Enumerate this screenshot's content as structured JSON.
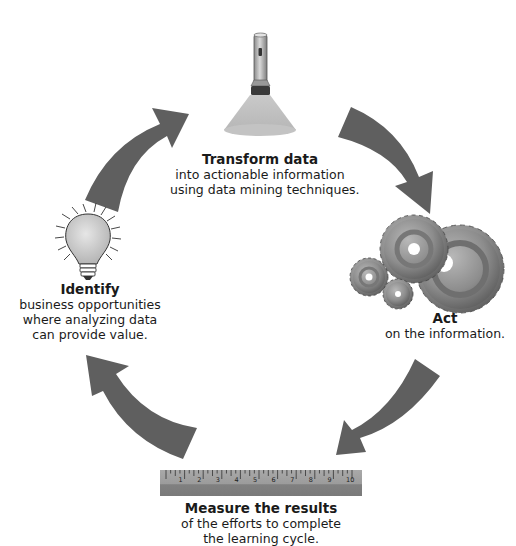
{
  "diagram": {
    "type": "cycle",
    "arrow_color": "#5f5f5f",
    "steps": [
      {
        "id": "transform",
        "icon": "flashlight-icon",
        "title": "Transform data",
        "lines": [
          "into actionable information",
          "using data mining techniques."
        ]
      },
      {
        "id": "act",
        "icon": "gears-icon",
        "title": "Act",
        "lines": [
          "on the information."
        ]
      },
      {
        "id": "measure",
        "icon": "ruler-icon",
        "title": "Measure the results",
        "lines": [
          "of the efforts to complete",
          "the learning cycle."
        ]
      },
      {
        "id": "identify",
        "icon": "lightbulb-icon",
        "title": "Identify",
        "lines": [
          "business opportunities",
          "where analyzing data",
          "can provide value."
        ]
      }
    ],
    "ruler_numbers": [
      "1",
      "2",
      "3",
      "4",
      "5",
      "6",
      "7",
      "8",
      "9",
      "10"
    ]
  }
}
